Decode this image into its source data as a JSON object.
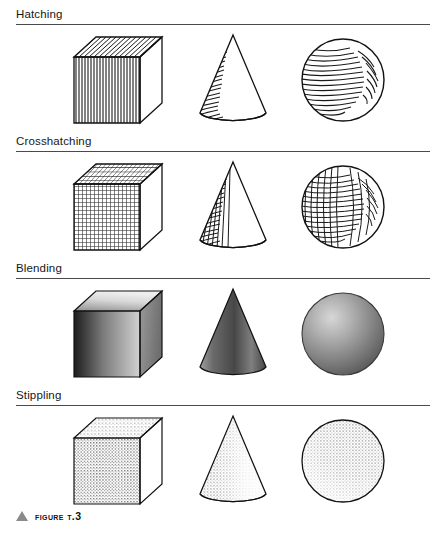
{
  "figure": {
    "caption_marker": "triangle-marker",
    "caption_label": "FIGURE T.3",
    "top_bleed_text": "",
    "background_color": "#ffffff",
    "rule_color": "#4a4a4a",
    "ink_color": "#1a1a1a"
  },
  "sections": [
    {
      "id": "hatching",
      "label": "Hatching",
      "technique": "parallel line shading",
      "shapes": [
        {
          "name": "cube",
          "render": "hatching",
          "caption": "cube with vertical hatching on front face and diagonal hatching on top face"
        },
        {
          "name": "cone",
          "render": "hatching",
          "caption": "cone with horizontal curved hatching on left side"
        },
        {
          "name": "sphere",
          "render": "hatching",
          "caption": "sphere with curved hatching leaving a highlight"
        }
      ]
    },
    {
      "id": "crosshatching",
      "label": "Crosshatching",
      "technique": "intersecting line shading",
      "shapes": [
        {
          "name": "cube",
          "render": "crosshatching",
          "caption": "cube with grid crosshatch on front and top faces"
        },
        {
          "name": "cone",
          "render": "crosshatching",
          "caption": "cone with crosshatch grid on shaded left side"
        },
        {
          "name": "sphere",
          "render": "crosshatching",
          "caption": "sphere with crosshatch mesh leaving a highlight"
        }
      ]
    },
    {
      "id": "blending",
      "label": "Blending",
      "technique": "smooth tonal gradient",
      "shapes": [
        {
          "name": "cube",
          "render": "blending",
          "caption": "cube with smooth gradient faces"
        },
        {
          "name": "cone",
          "render": "blending",
          "caption": "cone with smooth gradient from dark left to light right"
        },
        {
          "name": "sphere",
          "render": "blending",
          "caption": "sphere with radial gradient and upper-left highlight"
        }
      ]
    },
    {
      "id": "stippling",
      "label": "Stippling",
      "technique": "dot density shading",
      "shapes": [
        {
          "name": "cube",
          "render": "stippling",
          "caption": "cube with dense dot stippling on front and top faces"
        },
        {
          "name": "cone",
          "render": "stippling",
          "caption": "cone with dot stippling concentrated on left side"
        },
        {
          "name": "sphere",
          "render": "stippling",
          "caption": "sphere with dot stippling densest at lower-left edge"
        }
      ]
    }
  ]
}
